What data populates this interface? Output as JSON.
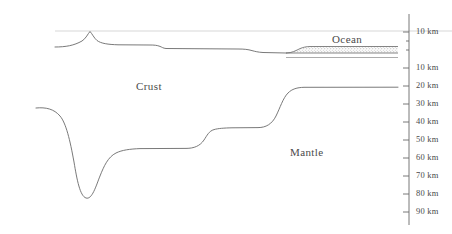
{
  "figure": {
    "kind": "geological-cross-section",
    "background_color": "#ffffff",
    "line_color": "#555555",
    "sea_level_line_color": "#cccccc",
    "ocean_fill_color": "#f2f2f2"
  },
  "layers": [
    {
      "name": "crust",
      "label": "Crust",
      "x": 136,
      "y": 80
    },
    {
      "name": "mantle",
      "label": "Mantle",
      "x": 290,
      "y": 146
    },
    {
      "name": "ocean",
      "label": "Ocean",
      "x": 332,
      "y": 33
    }
  ],
  "axis": {
    "name": "depth-scale",
    "x": 409,
    "top_y": 14,
    "bottom_y": 225,
    "tick_length": 6,
    "minor_tick_length": 3,
    "ticks": [
      {
        "label": "10 km",
        "y": 32,
        "kind": "major",
        "meaning": "elevation"
      },
      {
        "label": "",
        "y": 41,
        "kind": "minor",
        "meaning": "elevation"
      },
      {
        "label": "",
        "y": 50,
        "kind": "minor",
        "meaning": "sea-level"
      },
      {
        "label": "10 km",
        "y": 68,
        "kind": "major",
        "meaning": "depth"
      },
      {
        "label": "20 km",
        "y": 86,
        "kind": "major",
        "meaning": "depth"
      },
      {
        "label": "30 km",
        "y": 104,
        "kind": "major",
        "meaning": "depth"
      },
      {
        "label": "40 km",
        "y": 122,
        "kind": "major",
        "meaning": "depth"
      },
      {
        "label": "50 km",
        "y": 140,
        "kind": "major",
        "meaning": "depth"
      },
      {
        "label": "60 km",
        "y": 158,
        "kind": "major",
        "meaning": "depth"
      },
      {
        "label": "70 km",
        "y": 176,
        "kind": "major",
        "meaning": "depth"
      },
      {
        "label": "80 km",
        "y": 194,
        "kind": "major",
        "meaning": "depth"
      },
      {
        "label": "90 km",
        "y": 212,
        "kind": "major",
        "meaning": "depth"
      }
    ]
  },
  "geometry": {
    "sea_level_y": 31,
    "sea_level_line": "M 55 31 L 452 31",
    "topography": "M 55 47 C 66 47 74 45.5 82 41 C 86 38.5 88 33.5 90 31.5 C 92 33.5 94 38 97 40.5 C 101 43.5 108 44.5 118 44.8 L 150 45 C 154 45 157 45.2 160 46.4 C 162 47.2 163 48.2 166 48.5 L 238 49 C 244 49 248 49.4 252 50.6 C 255 51.4 258 52.2 263 52.5 L 286 53",
    "ocean_top": "M 286 53 C 292 53 296 50.5 300 48.6 C 303 47.3 306 46.6 310 46.5 L 398 46.5",
    "ocean_bottom": "M 286 53 L 398 53",
    "ocean_wedge_fill": "M 286 53 C 292 53 296 50.5 300 48.6 C 303 47.3 306 46.6 310 46.5 L 398 46.5 L 398 53 Z",
    "ocean_base_line": "M 286 57.5 L 398 57.5",
    "moho": "M 36 108 C 46 107 54 109 60 116 C 66 123 70 140 74 162 C 77 180 80 196 86 198 C 92 200 96 186 100 176 C 104 166 108 157 116 153 C 122 150 130 149 140 148.6 L 186 148.4 C 194 148.4 200 146 204 140 C 207 135.5 209 131 214 129.6 C 218 128.4 224 128 232 127.8 L 258 127.6 C 266 127.6 272 124 276 116 C 280 108 283 98 288 93 C 292 89 297 87.5 304 87.3 L 398 87.2"
  }
}
